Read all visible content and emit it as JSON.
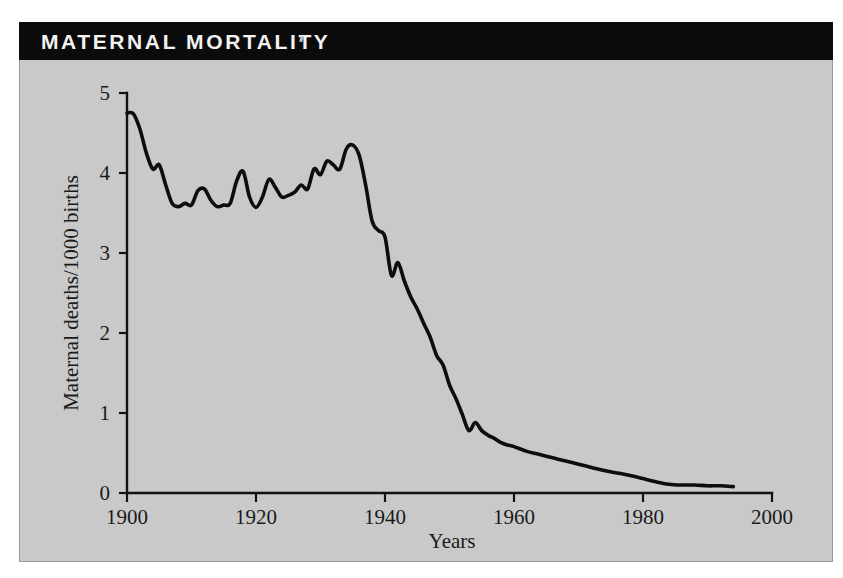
{
  "figure": {
    "title": "MATERNAL MORTALITY",
    "panel_background": "#c9c9c9",
    "banner_background": "#0b0b0b",
    "banner_text_color": "#f2f2f2"
  },
  "chart_data": {
    "type": "line",
    "title": "MATERNAL MORTALITY",
    "xlabel": "Years",
    "ylabel": "Maternal deaths/1000 births",
    "xlim": [
      1900,
      2000
    ],
    "ylim": [
      0,
      5
    ],
    "xticks": [
      1900,
      1920,
      1940,
      1960,
      1980,
      2000
    ],
    "xtick_labels": [
      "1900",
      "1920",
      "1940",
      "1960",
      "1980",
      "2000"
    ],
    "yticks": [
      0,
      1,
      2,
      3,
      4,
      5
    ],
    "ytick_labels": [
      "0",
      "1",
      "2",
      "3",
      "4",
      "5"
    ],
    "grid": false,
    "legend": null,
    "line_color": "#0d0d0d",
    "series": [
      {
        "name": "Maternal deaths per 1000 births",
        "x": [
          1900,
          1901,
          1902,
          1903,
          1904,
          1905,
          1906,
          1907,
          1908,
          1909,
          1910,
          1911,
          1912,
          1913,
          1914,
          1915,
          1916,
          1917,
          1918,
          1919,
          1920,
          1921,
          1922,
          1923,
          1924,
          1925,
          1926,
          1927,
          1928,
          1929,
          1930,
          1931,
          1932,
          1933,
          1934,
          1935,
          1936,
          1937,
          1938,
          1939,
          1940,
          1941,
          1942,
          1943,
          1944,
          1945,
          1946,
          1947,
          1948,
          1949,
          1950,
          1951,
          1952,
          1953,
          1954,
          1955,
          1956,
          1957,
          1958,
          1959,
          1960,
          1962,
          1964,
          1966,
          1968,
          1970,
          1972,
          1974,
          1976,
          1978,
          1980,
          1982,
          1984,
          1986,
          1988,
          1990,
          1992,
          1994
        ],
        "values": [
          4.75,
          4.74,
          4.55,
          4.25,
          4.05,
          4.1,
          3.85,
          3.62,
          3.58,
          3.62,
          3.6,
          3.78,
          3.8,
          3.66,
          3.58,
          3.6,
          3.62,
          3.9,
          4.02,
          3.7,
          3.57,
          3.7,
          3.92,
          3.82,
          3.7,
          3.72,
          3.76,
          3.85,
          3.8,
          4.05,
          3.98,
          4.15,
          4.1,
          4.05,
          4.3,
          4.35,
          4.22,
          3.85,
          3.4,
          3.28,
          3.2,
          2.72,
          2.88,
          2.65,
          2.45,
          2.3,
          2.12,
          1.95,
          1.72,
          1.6,
          1.35,
          1.18,
          0.98,
          0.78,
          0.88,
          0.78,
          0.72,
          0.68,
          0.63,
          0.6,
          0.58,
          0.52,
          0.48,
          0.44,
          0.4,
          0.36,
          0.32,
          0.28,
          0.25,
          0.22,
          0.18,
          0.14,
          0.11,
          0.1,
          0.1,
          0.09,
          0.09,
          0.08
        ]
      }
    ]
  }
}
